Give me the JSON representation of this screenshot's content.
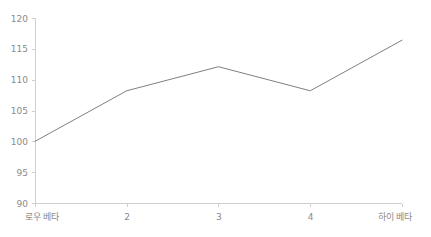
{
  "chart_data": {
    "type": "line",
    "title": "",
    "subtitle": "",
    "xlabel": "",
    "ylabel": "",
    "categories": [
      "로우 베타",
      "2",
      "3",
      "4",
      "하이 베타"
    ],
    "values": [
      100,
      108.2,
      112.1,
      108.2,
      116.4
    ],
    "series": [
      {
        "name": "",
        "values": [
          100,
          108.2,
          112.1,
          108.2,
          116.4
        ],
        "color": "#808080"
      }
    ],
    "ylim": [
      90,
      120
    ],
    "yticks": [
      90,
      95,
      100,
      105,
      110,
      115,
      120
    ],
    "ytick_labels": [
      "90",
      "95",
      "100",
      "105",
      "110",
      "115",
      "120"
    ],
    "xtick_labels": [
      "로우 베타",
      "2",
      "3",
      "4",
      "하이 베타"
    ],
    "grid": false,
    "legend": false,
    "legend_position": "none",
    "axis_color": "#d0d0d0",
    "tick_label_color": "#8a8a8a",
    "background": "#ffffff"
  },
  "layout": {
    "plot_left": 35,
    "plot_right": 402,
    "plot_top": 18,
    "plot_bottom": 203
  }
}
